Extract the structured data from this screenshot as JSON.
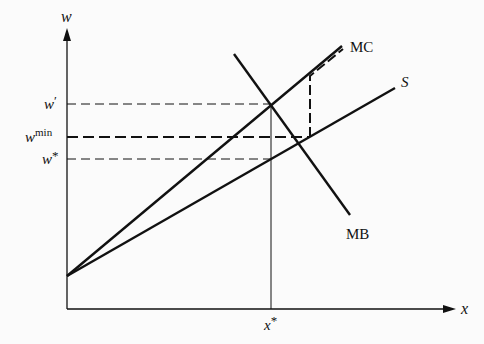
{
  "figure": {
    "axes": {
      "y_label": "w",
      "x_label": "x"
    },
    "y_ticks": [
      {
        "id": "w_prime",
        "base": "w",
        "sup": "′"
      },
      {
        "id": "w_min",
        "base": "w",
        "sup": "min"
      },
      {
        "id": "w_star",
        "base": "w",
        "sup": "*"
      }
    ],
    "x_ticks": [
      {
        "id": "x_star",
        "base": "x",
        "sup": "*"
      }
    ],
    "curves": {
      "mc": "MC",
      "s": "S",
      "mb": "MB"
    },
    "colors": {
      "ink": "#111111",
      "background": "#fbfbfb"
    }
  }
}
